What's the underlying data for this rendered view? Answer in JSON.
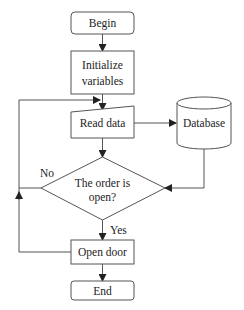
{
  "flowchart": {
    "nodes": {
      "begin": {
        "label": "Begin",
        "shape": "rounded-rect"
      },
      "init": {
        "line1": "Initialize",
        "line2": "variables",
        "shape": "rect"
      },
      "read": {
        "label": "Read data",
        "shape": "manual-input"
      },
      "database": {
        "label": "Database",
        "shape": "cylinder"
      },
      "decision": {
        "line1": "The order is",
        "line2": "open?",
        "shape": "diamond"
      },
      "open": {
        "label": "Open door",
        "shape": "rect"
      },
      "end": {
        "label": "End",
        "shape": "rounded-rect"
      }
    },
    "edges": {
      "no_label": "No",
      "yes_label": "Yes"
    }
  }
}
